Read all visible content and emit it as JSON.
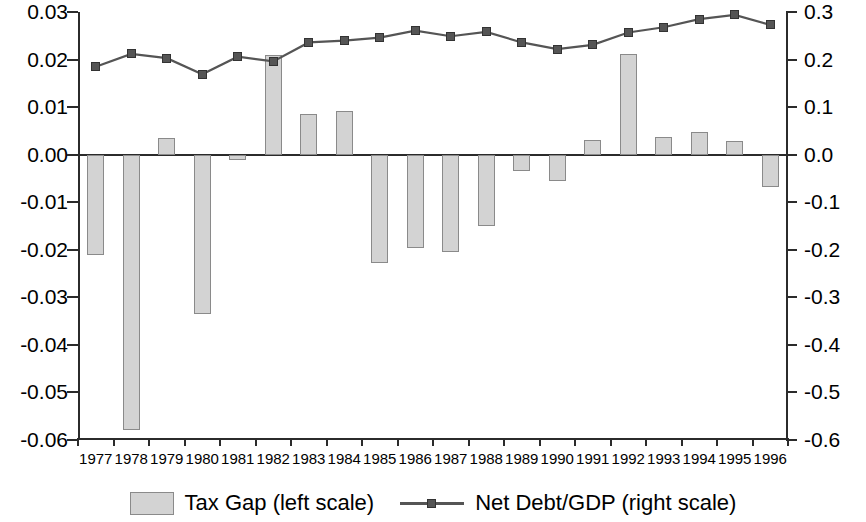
{
  "chart_data": {
    "type": "bar",
    "title": "",
    "subtitle": "",
    "xlabel": "",
    "ylabel": "",
    "grid": false,
    "legend_position": "bottom",
    "categories": [
      "1977",
      "1978",
      "1979",
      "1980",
      "1981",
      "1982",
      "1983",
      "1984",
      "1985",
      "1986",
      "1987",
      "1988",
      "1989",
      "1990",
      "1991",
      "1992",
      "1993",
      "1994",
      "1995",
      "1996"
    ],
    "left_axis": {
      "label": "",
      "ylim": [
        -0.06,
        0.03
      ],
      "ticks": [
        0.03,
        0.02,
        0.01,
        0.0,
        -0.01,
        -0.02,
        -0.03,
        -0.04,
        -0.05,
        -0.06
      ],
      "tick_labels": [
        "0.03",
        "0.02",
        "0.01",
        "0.00",
        "-0.01",
        "-0.02",
        "-0.03",
        "-0.04",
        "-0.05",
        "-0.06"
      ]
    },
    "right_axis": {
      "label": "",
      "ylim": [
        -0.6,
        0.3
      ],
      "ticks": [
        0.3,
        0.2,
        0.1,
        0.0,
        -0.1,
        -0.2,
        -0.3,
        -0.4,
        -0.5,
        -0.6
      ],
      "tick_labels": [
        "0.3",
        "0.2",
        "0.1",
        "0.0",
        "-0.1",
        "-0.2",
        "-0.3",
        "-0.4",
        "-0.5",
        "-0.6"
      ]
    },
    "series": [
      {
        "name": "Tax Gap (left scale)",
        "type": "bar",
        "axis": "left",
        "color": "#d3d3d3",
        "edge_color": "#8a8a8a",
        "values": [
          -0.021,
          -0.058,
          0.0035,
          -0.0335,
          -0.0012,
          0.0209,
          0.0086,
          0.0091,
          -0.0228,
          -0.0196,
          -0.0205,
          -0.0149,
          -0.0035,
          -0.0055,
          0.003,
          0.0212,
          0.0038,
          0.0047,
          0.0028,
          -0.0067
        ]
      },
      {
        "name": "Net Debt/GDP (right scale)",
        "type": "line",
        "axis": "right",
        "color": "#555555",
        "marker": "square",
        "values": [
          0.185,
          0.212,
          0.203,
          0.169,
          0.206,
          0.196,
          0.236,
          0.24,
          0.246,
          0.261,
          0.249,
          0.258,
          0.236,
          0.222,
          0.231,
          0.257,
          0.268,
          0.285,
          0.294,
          0.273
        ]
      }
    ]
  },
  "legend": {
    "items": [
      {
        "label": "Tax Gap (left scale)",
        "kind": "swatch"
      },
      {
        "label": "Net Debt/GDP (right scale)",
        "kind": "line"
      }
    ]
  }
}
